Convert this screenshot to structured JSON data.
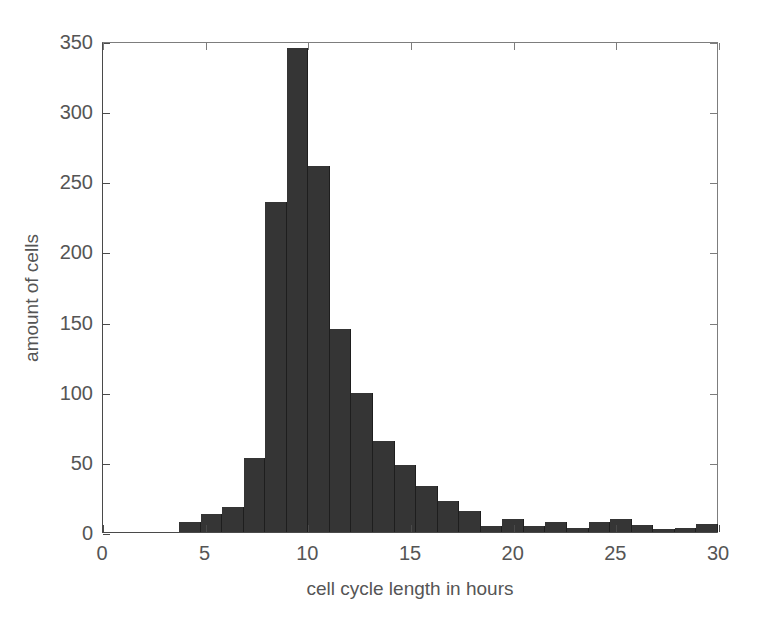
{
  "chart_data": {
    "type": "bar",
    "title": "",
    "xlabel": "cell cycle length in hours",
    "ylabel": "amount of cells",
    "xlim": [
      0,
      30
    ],
    "ylim": [
      0,
      350
    ],
    "xticks": [
      0,
      5,
      10,
      15,
      20,
      25,
      30
    ],
    "yticks": [
      0,
      50,
      100,
      150,
      200,
      250,
      300,
      350
    ],
    "xtick_labels": [
      "0",
      "5",
      "10",
      "15",
      "20",
      "25",
      "30"
    ],
    "ytick_labels": [
      "0",
      "50",
      "100",
      "150",
      "200",
      "250",
      "300",
      "350"
    ],
    "grid": false,
    "legend": null,
    "bar_color": "#353535",
    "axis_color": "#4a4a4a",
    "text_color": "#555555",
    "bin_width": 1.05,
    "bin_starts": [
      3.7,
      4.75,
      5.8,
      6.85,
      7.9,
      8.95,
      10.0,
      11.05,
      12.1,
      13.15,
      14.2,
      15.25,
      16.3,
      17.35,
      18.4,
      19.45,
      20.5,
      21.55,
      22.6,
      23.65,
      24.7,
      25.75,
      26.8,
      27.85,
      28.9
    ],
    "bin_centers": [
      4.2,
      5.3,
      6.3,
      7.4,
      8.4,
      9.5,
      10.5,
      11.6,
      12.6,
      13.7,
      14.7,
      15.8,
      16.8,
      17.9,
      18.9,
      20.0,
      21.0,
      22.1,
      23.1,
      24.2,
      25.2,
      26.3,
      27.3,
      28.4,
      29.4
    ],
    "values": [
      7,
      13,
      18,
      53,
      235,
      345,
      261,
      145,
      99,
      65,
      48,
      33,
      22,
      15,
      4,
      9,
      4,
      7,
      3,
      7,
      9,
      5,
      2,
      3,
      6
    ]
  },
  "figure": {
    "background": "#ffffff"
  }
}
